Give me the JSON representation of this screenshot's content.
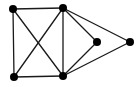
{
  "diagram": {
    "type": "undirected-graph",
    "node_color": "#000000",
    "edge_color": "#1a1a1a",
    "background": "#ffffff",
    "node_radius": 4,
    "nodes": [
      {
        "id": "A",
        "x": 13,
        "y": 9
      },
      {
        "id": "B",
        "x": 63,
        "y": 8
      },
      {
        "id": "C",
        "x": 97,
        "y": 42
      },
      {
        "id": "D",
        "x": 130,
        "y": 42
      },
      {
        "id": "E",
        "x": 14,
        "y": 77
      },
      {
        "id": "F",
        "x": 63,
        "y": 76
      }
    ],
    "edges": [
      [
        "A",
        "B"
      ],
      [
        "A",
        "E"
      ],
      [
        "A",
        "F"
      ],
      [
        "B",
        "E"
      ],
      [
        "B",
        "F"
      ],
      [
        "B",
        "C"
      ],
      [
        "B",
        "D"
      ],
      [
        "E",
        "F"
      ],
      [
        "F",
        "C"
      ],
      [
        "F",
        "D"
      ]
    ]
  }
}
